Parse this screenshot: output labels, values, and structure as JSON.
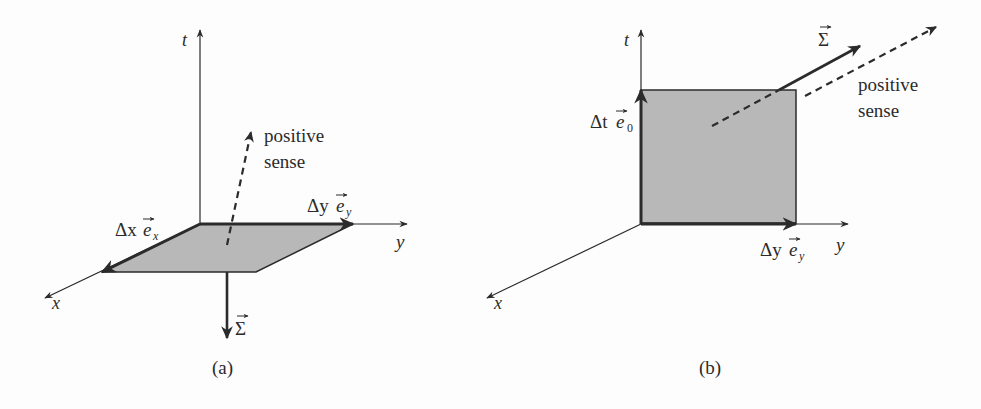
{
  "colors": {
    "ink": "#2b2b2b",
    "fill": "#b8b8b8",
    "background": "#fdfdfd"
  },
  "panel_a": {
    "caption": "(a)",
    "axes": {
      "t": "t",
      "x": "x",
      "y": "y"
    },
    "vector_x_label": {
      "delta": "Δx",
      "basis": "e",
      "sub": "x"
    },
    "vector_y_label": {
      "delta": "Δy",
      "basis": "e",
      "sub": "y"
    },
    "sigma_label": "Σ",
    "positive_sense": [
      "positive",
      "sense"
    ]
  },
  "panel_b": {
    "caption": "(b)",
    "axes": {
      "t": "t",
      "x": "x",
      "y": "y"
    },
    "vector_t_label": {
      "delta": "Δt",
      "basis": "e",
      "sub": "0"
    },
    "vector_y_label": {
      "delta": "Δy",
      "basis": "e",
      "sub": "y"
    },
    "sigma_label": "Σ",
    "positive_sense": [
      "positive",
      "sense"
    ]
  }
}
